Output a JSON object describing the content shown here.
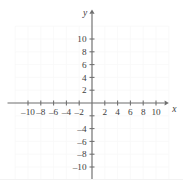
{
  "figure": {
    "kind": "cartesian-coordinate-plane",
    "background_color": "#ffffff",
    "axis_color": "#6e6e6e",
    "grid_color": "#f7f7f7",
    "label_color": "#3d3d3d"
  },
  "axis_names": {
    "x": "x",
    "y": "y"
  },
  "chart_data": {
    "type": "scatter",
    "title": "",
    "xlabel": "x",
    "ylabel": "y",
    "xlim": [
      -12,
      12
    ],
    "ylim": [
      -12,
      12
    ],
    "grid": true,
    "grid_step": 2,
    "legend": "none",
    "series": [
      {
        "name": "",
        "x": [],
        "y": []
      }
    ],
    "x_ticks": [
      -10,
      -8,
      -6,
      -4,
      -2,
      2,
      4,
      6,
      8,
      10
    ],
    "y_ticks": [
      -10,
      -8,
      -6,
      -4,
      -2,
      2,
      4,
      6,
      8,
      10
    ],
    "x_tick_labels": [
      "–10",
      "–8",
      "–6",
      "–4",
      "–2",
      "2",
      "4",
      "6",
      "8",
      "10"
    ],
    "y_tick_labels": [
      "–10",
      "–8",
      "–6",
      "–4",
      "",
      "2",
      "4",
      "6",
      "8",
      "10"
    ],
    "annotations": []
  },
  "geometry": {
    "origin_x": 92,
    "origin_y": 103,
    "unit_px": 6.4,
    "x_axis_start": -13.2,
    "x_axis_end": 12.0,
    "y_axis_start": -11.9,
    "y_axis_end": 14.6,
    "arrow_x": true,
    "arrow_y": true,
    "grid_min": -12,
    "grid_max": 12
  }
}
